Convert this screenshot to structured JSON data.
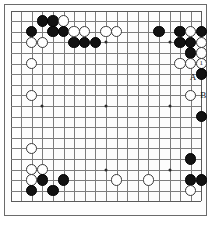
{
  "diagram": {
    "type": "go-board",
    "size": 19,
    "geometry": {
      "origin_x": 10.5,
      "origin_y": 10.5,
      "spacing": 10.6,
      "stone_diameter": 11.4
    },
    "colors": {
      "background": "#ffffff",
      "board": "#fdfdfd",
      "grid_line": "#7d7d7d",
      "edge_line": "#5a5a5a",
      "black_stone": "#121212",
      "white_stone": "#ffffff",
      "stone_outline": "#3a3a3a",
      "star_point": "#2b2b2b",
      "label_text": "#111111"
    },
    "star_points": [
      {
        "col": 4,
        "row": 4
      },
      {
        "col": 10,
        "row": 4
      },
      {
        "col": 16,
        "row": 4
      },
      {
        "col": 4,
        "row": 10
      },
      {
        "col": 10,
        "row": 10
      },
      {
        "col": 16,
        "row": 10
      },
      {
        "col": 4,
        "row": 16
      },
      {
        "col": 10,
        "row": 16
      },
      {
        "col": 16,
        "row": 16
      }
    ],
    "stones": [
      {
        "col": 4,
        "row": 2,
        "color": "black"
      },
      {
        "col": 5,
        "row": 2,
        "color": "black"
      },
      {
        "col": 6,
        "row": 2,
        "color": "white"
      },
      {
        "col": 3,
        "row": 3,
        "color": "black"
      },
      {
        "col": 5,
        "row": 3,
        "color": "black"
      },
      {
        "col": 6,
        "row": 3,
        "color": "black"
      },
      {
        "col": 7,
        "row": 3,
        "color": "white"
      },
      {
        "col": 8,
        "row": 3,
        "color": "white"
      },
      {
        "col": 10,
        "row": 3,
        "color": "white"
      },
      {
        "col": 11,
        "row": 3,
        "color": "white"
      },
      {
        "col": 15,
        "row": 3,
        "color": "black"
      },
      {
        "col": 17,
        "row": 3,
        "color": "black"
      },
      {
        "col": 18,
        "row": 3,
        "color": "white"
      },
      {
        "col": 19,
        "row": 3,
        "color": "black"
      },
      {
        "col": 3,
        "row": 4,
        "color": "white"
      },
      {
        "col": 4,
        "row": 4,
        "color": "white"
      },
      {
        "col": 7,
        "row": 4,
        "color": "black"
      },
      {
        "col": 8,
        "row": 4,
        "color": "black"
      },
      {
        "col": 9,
        "row": 4,
        "color": "black"
      },
      {
        "col": 17,
        "row": 4,
        "color": "black"
      },
      {
        "col": 18,
        "row": 4,
        "color": "black"
      },
      {
        "col": 19,
        "row": 4,
        "color": "white"
      },
      {
        "col": 18,
        "row": 5,
        "color": "black"
      },
      {
        "col": 19,
        "row": 5,
        "color": "white"
      },
      {
        "col": 3,
        "row": 6,
        "color": "white"
      },
      {
        "col": 17,
        "row": 6,
        "color": "white"
      },
      {
        "col": 18,
        "row": 6,
        "color": "white"
      },
      {
        "col": 19,
        "row": 6,
        "color": "white",
        "number": "1"
      },
      {
        "col": 19,
        "row": 7,
        "color": "black"
      },
      {
        "col": 3,
        "row": 9,
        "color": "white"
      },
      {
        "col": 18,
        "row": 9,
        "color": "white"
      },
      {
        "col": 19,
        "row": 11,
        "color": "black"
      },
      {
        "col": 3,
        "row": 14,
        "color": "white"
      },
      {
        "col": 3,
        "row": 16,
        "color": "white"
      },
      {
        "col": 4,
        "row": 16,
        "color": "white"
      },
      {
        "col": 18,
        "row": 15,
        "color": "black"
      },
      {
        "col": 3,
        "row": 17,
        "color": "white"
      },
      {
        "col": 4,
        "row": 17,
        "color": "black"
      },
      {
        "col": 6,
        "row": 17,
        "color": "black"
      },
      {
        "col": 11,
        "row": 17,
        "color": "white"
      },
      {
        "col": 14,
        "row": 17,
        "color": "white"
      },
      {
        "col": 18,
        "row": 17,
        "color": "black"
      },
      {
        "col": 19,
        "row": 17,
        "color": "black"
      },
      {
        "col": 3,
        "row": 18,
        "color": "black"
      },
      {
        "col": 5,
        "row": 18,
        "color": "black"
      },
      {
        "col": 18,
        "row": 18,
        "color": "white"
      }
    ],
    "labels": [
      {
        "text": "A",
        "col": 18,
        "row": 8,
        "dx": -1,
        "dy": -7
      },
      {
        "text": "B",
        "col": 19,
        "row": 9,
        "dx": -1,
        "dy": 1
      }
    ]
  }
}
